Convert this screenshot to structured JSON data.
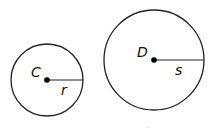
{
  "diagram": {
    "circles": [
      {
        "center_label": "C",
        "radius_label": "r",
        "cx": 47,
        "cy": 80,
        "r": 36
      },
      {
        "center_label": "D",
        "radius_label": "s",
        "cx": 154,
        "cy": 60,
        "r": 50
      }
    ],
    "stroke_color": "#222222"
  }
}
